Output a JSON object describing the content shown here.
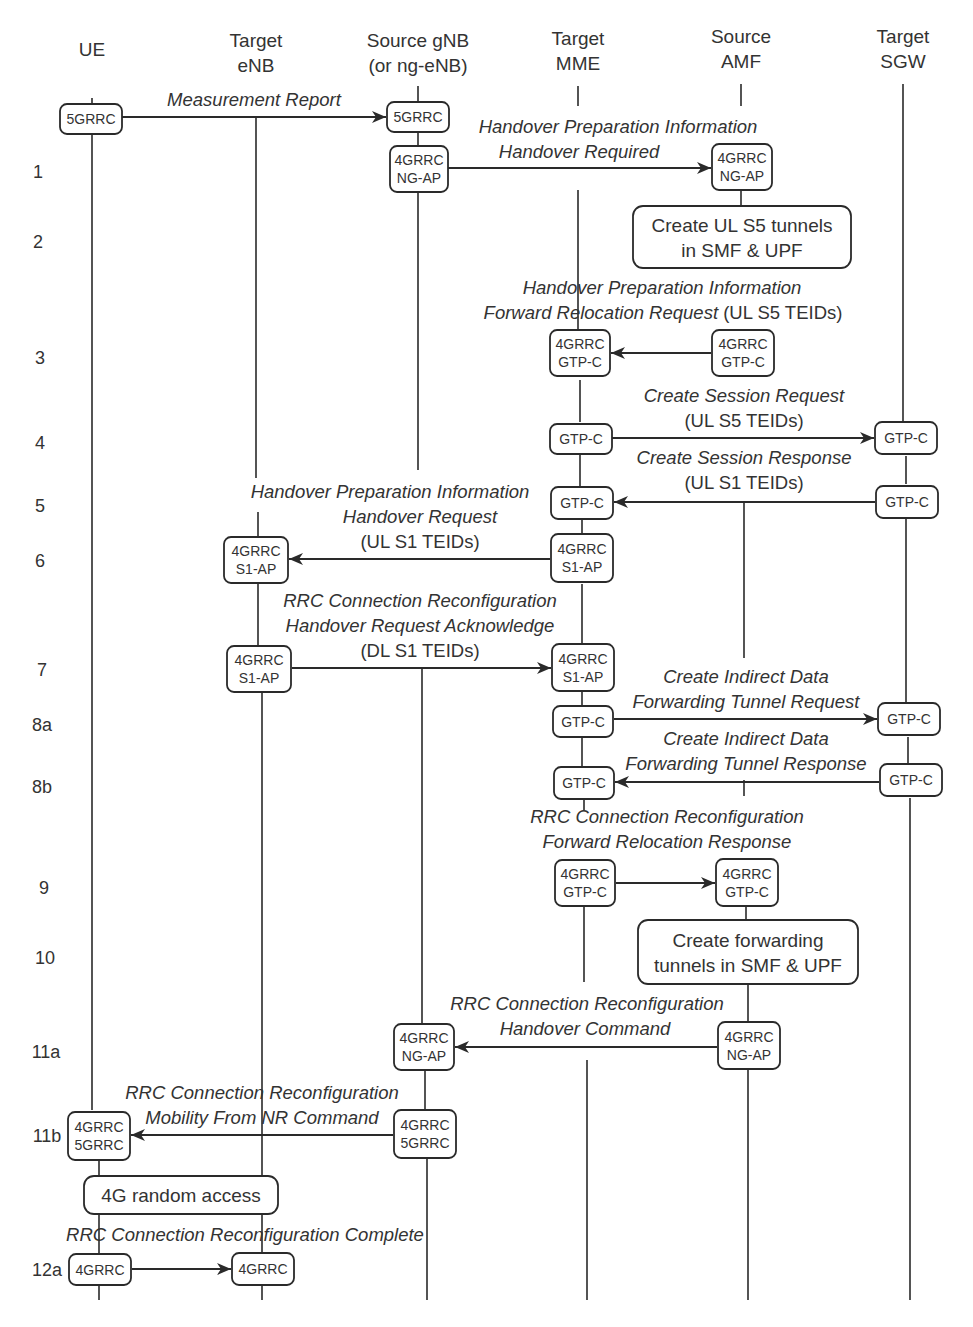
{
  "actors": [
    {
      "id": "ue",
      "x": 92,
      "lines": [
        "UE"
      ],
      "label_y": [
        56
      ]
    },
    {
      "id": "target_enb",
      "x": 256,
      "lines": [
        "Target",
        "eNB"
      ],
      "label_y": [
        47,
        72
      ]
    },
    {
      "id": "source_gnb",
      "x": 418,
      "lines": [
        "Source gNB",
        "(or ng-eNB)"
      ],
      "label_y": [
        47,
        72
      ]
    },
    {
      "id": "target_mme",
      "x": 578,
      "lines": [
        "Target",
        "MME"
      ],
      "label_y": [
        45,
        70
      ]
    },
    {
      "id": "source_amf",
      "x": 741,
      "lines": [
        "Source",
        "AMF"
      ],
      "label_y": [
        43,
        68
      ]
    },
    {
      "id": "target_sgw",
      "x": 903,
      "lines": [
        "Target",
        "SGW"
      ],
      "label_y": [
        43,
        68
      ]
    }
  ],
  "steps": [
    {
      "label": "1",
      "x": 38,
      "y": 178
    },
    {
      "label": "2",
      "x": 38,
      "y": 248
    },
    {
      "label": "3",
      "x": 40,
      "y": 364
    },
    {
      "label": "4",
      "x": 40,
      "y": 449
    },
    {
      "label": "5",
      "x": 40,
      "y": 512
    },
    {
      "label": "6",
      "x": 40,
      "y": 567
    },
    {
      "label": "7",
      "x": 42,
      "y": 676
    },
    {
      "label": "8a",
      "x": 42,
      "y": 731
    },
    {
      "label": "8b",
      "x": 42,
      "y": 793
    },
    {
      "label": "9",
      "x": 44,
      "y": 894
    },
    {
      "label": "10",
      "x": 45,
      "y": 964
    },
    {
      "label": "11a",
      "x": 46,
      "y": 1058
    },
    {
      "label": "11b",
      "x": 47,
      "y": 1142
    },
    {
      "label": "12a",
      "x": 47,
      "y": 1276
    }
  ],
  "lifeline_segments": [
    [
      92,
      98,
      92,
      108
    ],
    [
      92,
      132,
      92,
      1110
    ],
    [
      99,
      1160,
      99,
      1178
    ],
    [
      99,
      1212,
      99,
      1256
    ],
    [
      99,
      1285,
      99,
      1300
    ],
    [
      256,
      118,
      256,
      478
    ],
    [
      258,
      512,
      258,
      537
    ],
    [
      258,
      583,
      258,
      648
    ],
    [
      262,
      693,
      262,
      1178
    ],
    [
      262,
      1212,
      262,
      1254
    ],
    [
      262,
      1285,
      262,
      1300
    ],
    [
      418,
      86,
      418,
      106
    ],
    [
      418,
      130,
      418,
      146
    ],
    [
      418,
      190,
      418,
      470
    ],
    [
      422,
      668,
      422,
      1024
    ],
    [
      425,
      1068,
      425,
      1110
    ],
    [
      427,
      1158,
      427,
      1300
    ],
    [
      578,
      86,
      578,
      106
    ],
    [
      578,
      190,
      578,
      330
    ],
    [
      580,
      380,
      580,
      422
    ],
    [
      580,
      454,
      580,
      486
    ],
    [
      582,
      520,
      582,
      534
    ],
    [
      582,
      584,
      582,
      645
    ],
    [
      582,
      692,
      582,
      706
    ],
    [
      582,
      737,
      582,
      766
    ],
    [
      584,
      800,
      584,
      810
    ],
    [
      584,
      906,
      584,
      982
    ],
    [
      587,
      1060,
      587,
      1300
    ],
    [
      741,
      84,
      741,
      106
    ],
    [
      741,
      190,
      741,
      206
    ],
    [
      744,
      502,
      744,
      658
    ],
    [
      744,
      780,
      744,
      796
    ],
    [
      746,
      906,
      746,
      920
    ],
    [
      748,
      985,
      748,
      1022
    ],
    [
      748,
      1070,
      748,
      1300
    ],
    [
      903,
      84,
      903,
      422
    ],
    [
      906,
      456,
      906,
      484
    ],
    [
      906,
      518,
      906,
      702
    ],
    [
      908,
      737,
      908,
      763
    ],
    [
      910,
      798,
      910,
      1300
    ]
  ],
  "nodes": [
    {
      "id": "n_ue_mr",
      "x": 60,
      "y": 104,
      "w": 62,
      "h": 30,
      "lines": [
        "5GRRC"
      ],
      "fs": 13.5
    },
    {
      "id": "n_gnb_mr",
      "x": 387,
      "y": 102,
      "w": 62,
      "h": 30,
      "lines": [
        "5GRRC"
      ],
      "fs": 13.5
    },
    {
      "id": "n_gnb_1",
      "x": 390,
      "y": 146,
      "w": 58,
      "h": 46,
      "lines": [
        "4GRRC",
        "NG-AP"
      ],
      "fs": 13.5
    },
    {
      "id": "n_amf_1",
      "x": 712,
      "y": 144,
      "w": 60,
      "h": 46,
      "lines": [
        "4GRRC",
        "NG-AP"
      ],
      "fs": 13.5
    },
    {
      "id": "n_mme_3",
      "x": 550,
      "y": 330,
      "w": 60,
      "h": 46,
      "lines": [
        "4GRRC",
        "GTP-C"
      ],
      "fs": 13.5
    },
    {
      "id": "n_amf_3",
      "x": 712,
      "y": 330,
      "w": 62,
      "h": 46,
      "lines": [
        "4GRRC",
        "GTP-C"
      ],
      "fs": 13.5
    },
    {
      "id": "n_mme_4",
      "x": 550,
      "y": 424,
      "w": 62,
      "h": 30,
      "lines": [
        "GTP-C"
      ],
      "fs": 13.5
    },
    {
      "id": "n_sgw_4",
      "x": 875,
      "y": 422,
      "w": 62,
      "h": 32,
      "lines": [
        "GTP-C"
      ],
      "fs": 13.5
    },
    {
      "id": "n_mme_5",
      "x": 551,
      "y": 487,
      "w": 62,
      "h": 32,
      "lines": [
        "GTP-C"
      ],
      "fs": 13.5
    },
    {
      "id": "n_sgw_5",
      "x": 876,
      "y": 486,
      "w": 62,
      "h": 32,
      "lines": [
        "GTP-C"
      ],
      "fs": 13.5
    },
    {
      "id": "n_enb_6",
      "x": 224,
      "y": 537,
      "w": 64,
      "h": 46,
      "lines": [
        "4GRRC",
        "S1-AP"
      ],
      "fs": 13.5
    },
    {
      "id": "n_mme_6",
      "x": 551,
      "y": 534,
      "w": 62,
      "h": 48,
      "lines": [
        "4GRRC",
        "S1-AP"
      ],
      "fs": 13.5
    },
    {
      "id": "n_enb_7",
      "x": 227,
      "y": 646,
      "w": 64,
      "h": 46,
      "lines": [
        "4GRRC",
        "S1-AP"
      ],
      "fs": 13.5
    },
    {
      "id": "n_mme_7",
      "x": 552,
      "y": 644,
      "w": 62,
      "h": 47,
      "lines": [
        "4GRRC",
        "S1-AP"
      ],
      "fs": 13.5
    },
    {
      "id": "n_mme_8a",
      "x": 553,
      "y": 706,
      "w": 60,
      "h": 31,
      "lines": [
        "GTP-C"
      ],
      "fs": 13.5
    },
    {
      "id": "n_sgw_8a",
      "x": 878,
      "y": 703,
      "w": 62,
      "h": 32,
      "lines": [
        "GTP-C"
      ],
      "fs": 13.5
    },
    {
      "id": "n_mme_8b",
      "x": 554,
      "y": 767,
      "w": 60,
      "h": 32,
      "lines": [
        "GTP-C"
      ],
      "fs": 13.5
    },
    {
      "id": "n_sgw_8b",
      "x": 880,
      "y": 764,
      "w": 62,
      "h": 32,
      "lines": [
        "GTP-C"
      ],
      "fs": 13.5
    },
    {
      "id": "n_mme_9",
      "x": 555,
      "y": 860,
      "w": 60,
      "h": 46,
      "lines": [
        "4GRRC",
        "GTP-C"
      ],
      "fs": 13.5
    },
    {
      "id": "n_amf_9",
      "x": 716,
      "y": 859,
      "w": 62,
      "h": 47,
      "lines": [
        "4GRRC",
        "GTP-C"
      ],
      "fs": 13.5
    },
    {
      "id": "n_gnb_11a",
      "x": 394,
      "y": 1024,
      "w": 60,
      "h": 46,
      "lines": [
        "4GRRC",
        "NG-AP"
      ],
      "fs": 13.5
    },
    {
      "id": "n_amf_11a",
      "x": 718,
      "y": 1022,
      "w": 62,
      "h": 47,
      "lines": [
        "4GRRC",
        "NG-AP"
      ],
      "fs": 13.5
    },
    {
      "id": "n_ue_11b",
      "x": 68,
      "y": 1112,
      "w": 62,
      "h": 48,
      "lines": [
        "4GRRC",
        "5GRRC"
      ],
      "fs": 13.5
    },
    {
      "id": "n_gnb_11b",
      "x": 394,
      "y": 1110,
      "w": 62,
      "h": 48,
      "lines": [
        "4GRRC",
        "5GRRC"
      ],
      "fs": 13.5
    },
    {
      "id": "n_ue_12a",
      "x": 69,
      "y": 1254,
      "w": 62,
      "h": 31,
      "lines": [
        "4GRRC"
      ],
      "fs": 13.5
    },
    {
      "id": "n_enb_12a",
      "x": 232,
      "y": 1253,
      "w": 62,
      "h": 32,
      "lines": [
        "4GRRC"
      ],
      "fs": 13.5
    }
  ],
  "processes": [
    {
      "id": "p_create_ul_s5",
      "x": 633,
      "y": 206,
      "w": 218,
      "h": 62,
      "lines": [
        "Create UL S5 tunnels",
        "in SMF & UPF"
      ]
    },
    {
      "id": "p_create_fwd",
      "x": 638,
      "y": 920,
      "w": 220,
      "h": 64,
      "lines": [
        "Create forwarding",
        "tunnels in SMF & UPF"
      ]
    },
    {
      "id": "p_4g_random_access",
      "x": 84,
      "y": 1176,
      "w": 194,
      "h": 38,
      "lines": [
        "4G random access"
      ]
    }
  ],
  "messages": [
    {
      "id": "m_measurement_report",
      "x1": 122,
      "x2": 386,
      "y": 117,
      "dir": "right",
      "label": [
        {
          "text": "Measurement Report",
          "x": 254,
          "y": 106
        }
      ]
    },
    {
      "id": "m_handover_required",
      "x1": 448,
      "x2": 711,
      "y": 168,
      "dir": "right",
      "label": [
        {
          "text": "Handover Preparation Information",
          "x": 618,
          "y": 133
        },
        {
          "text": "Handover Required",
          "x": 579,
          "y": 158
        }
      ]
    },
    {
      "id": "m_forward_relocation_request",
      "x1": 611,
      "x2": 711,
      "y": 353,
      "dir": "left",
      "label": [
        {
          "text": "Handover Preparation Information",
          "x": 662,
          "y": 294
        },
        {
          "text": "Forward Relocation Request",
          "x": 591,
          "y": 319,
          "suffix": " (UL S5 TEIDs)"
        }
      ]
    },
    {
      "id": "m_create_session_request",
      "x1": 612,
      "x2": 874,
      "y": 438,
      "dir": "right",
      "label": [
        {
          "text": "Create Session Request",
          "x": 744,
          "y": 402
        },
        {
          "text": "(UL S5 TEIDs)",
          "x": 744,
          "y": 427,
          "upright": true
        }
      ]
    },
    {
      "id": "m_create_session_response",
      "x1": 614,
      "x2": 875,
      "y": 502,
      "dir": "left",
      "label": [
        {
          "text": "Create Session Response",
          "x": 744,
          "y": 464
        },
        {
          "text": "(UL S1 TEIDs)",
          "x": 744,
          "y": 489,
          "upright": true
        }
      ]
    },
    {
      "id": "m_handover_request",
      "x1": 289,
      "x2": 550,
      "y": 559,
      "dir": "left",
      "label": [
        {
          "text": "Handover Preparation Information",
          "x": 390,
          "y": 498
        },
        {
          "text": "Handover Request",
          "x": 420,
          "y": 523
        },
        {
          "text": "(UL S1 TEIDs)",
          "x": 420,
          "y": 548,
          "upright": true
        }
      ]
    },
    {
      "id": "m_handover_request_ack",
      "x1": 292,
      "x2": 551,
      "y": 668,
      "dir": "right",
      "label": [
        {
          "text": "RRC Connection Reconfiguration",
          "x": 420,
          "y": 607
        },
        {
          "text": "Handover Request Acknowledge",
          "x": 420,
          "y": 632
        },
        {
          "text": "(DL S1 TEIDs)",
          "x": 420,
          "y": 657,
          "upright": true
        }
      ]
    },
    {
      "id": "m_create_idf_tunnel_request",
      "x1": 614,
      "x2": 877,
      "y": 719,
      "dir": "right",
      "label": [
        {
          "text": "Create Indirect Data",
          "x": 746,
          "y": 683
        },
        {
          "text": "Forwarding Tunnel Request",
          "x": 746,
          "y": 708
        }
      ]
    },
    {
      "id": "m_create_idf_tunnel_response",
      "x1": 615,
      "x2": 879,
      "y": 782,
      "dir": "left",
      "label": [
        {
          "text": "Create Indirect Data",
          "x": 746,
          "y": 745
        },
        {
          "text": "Forwarding Tunnel Response",
          "x": 746,
          "y": 770
        }
      ]
    },
    {
      "id": "m_forward_relocation_response",
      "x1": 616,
      "x2": 715,
      "y": 883,
      "dir": "right",
      "label": [
        {
          "text": "RRC Connection Reconfiguration",
          "x": 667,
          "y": 823
        },
        {
          "text": "Forward Relocation Response",
          "x": 667,
          "y": 848
        }
      ]
    },
    {
      "id": "m_handover_command",
      "x1": 455,
      "x2": 717,
      "y": 1047,
      "dir": "left",
      "label": [
        {
          "text": "RRC Connection Reconfiguration",
          "x": 587,
          "y": 1010
        },
        {
          "text": "Handover Command",
          "x": 585,
          "y": 1035
        }
      ]
    },
    {
      "id": "m_mobility_from_nr_command",
      "x1": 131,
      "x2": 393,
      "y": 1135,
      "dir": "left",
      "label": [
        {
          "text": "RRC Connection Reconfiguration",
          "x": 262,
          "y": 1099
        },
        {
          "text": "Mobility From NR Command",
          "x": 262,
          "y": 1124
        }
      ]
    },
    {
      "id": "m_rrc_reconfig_complete",
      "x1": 132,
      "x2": 231,
      "y": 1269,
      "dir": "right",
      "label": [
        {
          "text": "RRC Connection Reconfiguration Complete",
          "x": 245,
          "y": 1241
        }
      ]
    }
  ],
  "colors": {
    "line": "#2a2a2a",
    "text": "#333333",
    "background": "#ffffff"
  }
}
